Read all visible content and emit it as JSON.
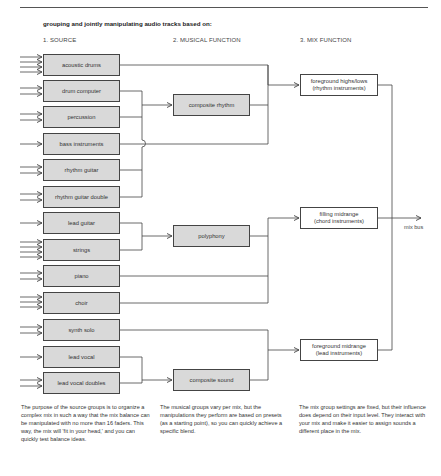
{
  "heading": "grouping and jointly manipulating audio tracks based on:",
  "columns": {
    "source": "1. SOURCE",
    "musical": "2. MUSICAL FUNCTION",
    "mix": "3. MIX FUNCTION"
  },
  "source_groups": [
    {
      "label": "acoustic drums",
      "inputs": 4
    },
    {
      "label": "drum computer",
      "inputs": 2
    },
    {
      "label": "percussion",
      "inputs": 2
    },
    {
      "label": "bass instruments",
      "inputs": 1
    },
    {
      "label": "rhythm guitar",
      "inputs": 2
    },
    {
      "label": "rhythm guitar double",
      "inputs": 2
    },
    {
      "label": "lead guitar",
      "inputs": 1
    },
    {
      "label": "strings",
      "inputs": 4
    },
    {
      "label": "piano",
      "inputs": 2
    },
    {
      "label": "choir",
      "inputs": 3
    },
    {
      "label": "synth solo",
      "inputs": 2
    },
    {
      "label": "lead vocal",
      "inputs": 1
    },
    {
      "label": "lead vocal doubles",
      "inputs": 2
    }
  ],
  "musical_groups": [
    {
      "label": "composite rhythm"
    },
    {
      "label": "polyphony"
    },
    {
      "label": "composite sound"
    }
  ],
  "mix_groups": [
    {
      "line1": "foreground highs/lows",
      "line2": "(rhythm instruments)"
    },
    {
      "line1": "filling midrange",
      "line2": "(chord instruments)"
    },
    {
      "line1": "foreground midrange",
      "line2": "(lead instruments)"
    }
  ],
  "output": {
    "label": "mix bus"
  },
  "notes": {
    "source": "The purpose of the source groups is to organize a complex mix in such a way that the mix balance can be manipulated with no more than 16 faders. This way, the mix will 'fit in your head,' and you can quickly test balance ideas.",
    "musical": "The musical groups vary per mix, but the manipulations they perform are based on presets (as a starting point), so you can quickly achieve a specific blend.",
    "mix": "The mix group settings are fixed, but their influence does depend on their input level. They interact with your mix and make it easier to assign sounds a different place in the mix."
  },
  "colors": {
    "box_fill": "#d9d9d9",
    "line": "#444444",
    "text": "#333333"
  }
}
